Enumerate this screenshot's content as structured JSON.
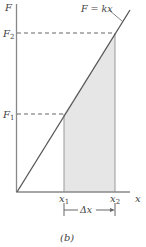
{
  "figure": {
    "caption": "(b)",
    "line_label": "F = kx",
    "y_axis_label": "F",
    "x_axis_label": "x",
    "y_ticks": [
      {
        "name": "F",
        "sub": "2"
      },
      {
        "name": "F",
        "sub": "1"
      }
    ],
    "x_ticks": [
      {
        "name": "x",
        "sub": "1"
      },
      {
        "name": "x",
        "sub": "2"
      }
    ],
    "interval_label": "Δx",
    "colors": {
      "axis": "#888888",
      "line": "#555555",
      "shade": "#e6e6e6",
      "dashed": "#666666"
    }
  }
}
